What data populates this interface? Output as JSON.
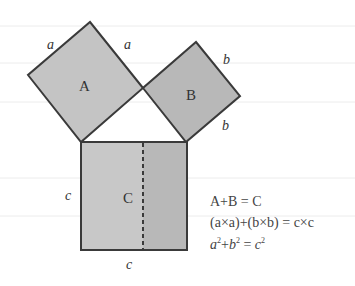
{
  "diagram": {
    "colors": {
      "square_fill": "#c4c4c4",
      "square_b_fill": "#b8b8b8",
      "square_c_left": "#c8c8c8",
      "square_c_right": "#b8b8b8",
      "stroke": "#3a3a3a",
      "guide_lines": "#ececec"
    },
    "squares": [
      {
        "name": "A",
        "label": "A",
        "side_labels": [
          "a",
          "a"
        ]
      },
      {
        "name": "B",
        "label": "B",
        "side_labels": [
          "b",
          "b"
        ]
      },
      {
        "name": "C",
        "label": "C",
        "side_labels": [
          "c",
          "c"
        ]
      }
    ],
    "equations": {
      "line1": "A+B = C",
      "line2": "(a×a)+(b×b) = c×c",
      "line3": {
        "a": "a",
        "plus": "+",
        "b": "b",
        "eq": " = ",
        "c": "c",
        "exp": "2"
      }
    }
  }
}
